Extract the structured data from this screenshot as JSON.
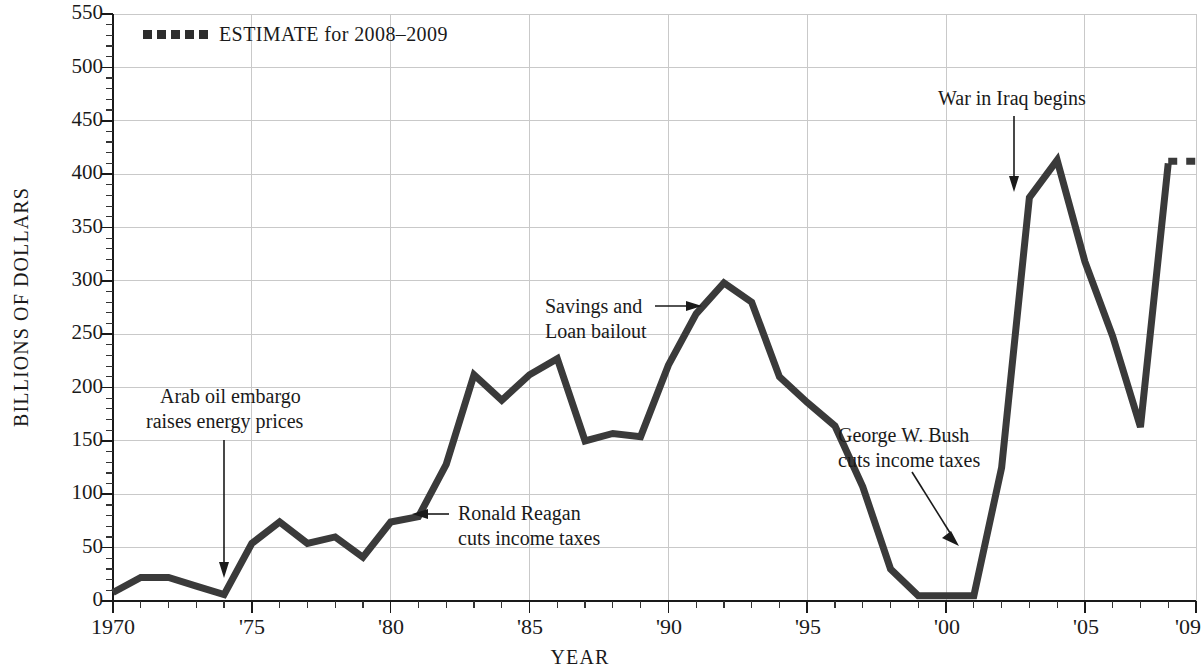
{
  "chart_data": {
    "type": "line",
    "title": "",
    "xlabel": "YEAR",
    "ylabel": "BILLIONS OF DOLLARS",
    "xlim": [
      1970,
      2009
    ],
    "ylim": [
      0,
      550
    ],
    "grid": true,
    "y_ticks": [
      0,
      50,
      100,
      150,
      200,
      250,
      300,
      350,
      400,
      450,
      500,
      550
    ],
    "y_tick_labels": [
      "0",
      "50",
      "100",
      "150",
      "200",
      "250",
      "300",
      "350",
      "400",
      "450",
      "500",
      "550"
    ],
    "y_minor_step": 10,
    "x_ticks": [
      1970,
      1975,
      1980,
      1985,
      1990,
      1995,
      2000,
      2005,
      2009
    ],
    "x_tick_labels": [
      "1970",
      "'75",
      "'80",
      "'85",
      "'90",
      "'95",
      "'00",
      "'05",
      "'09"
    ],
    "x_minor_step": 1,
    "legend_position": "top-left",
    "legend": [
      {
        "label": "ESTIMATE for 2008–2009",
        "style": "dotted",
        "color": "#2d2d2d"
      }
    ],
    "series": [
      {
        "name": "Federal budget deficit",
        "style": "solid",
        "color": "#3a3a3a",
        "x": [
          1970,
          1971,
          1972,
          1973,
          1974,
          1975,
          1976,
          1977,
          1978,
          1979,
          1980,
          1981,
          1982,
          1983,
          1984,
          1985,
          1986,
          1987,
          1988,
          1989,
          1990,
          1991,
          1992,
          1993,
          1994,
          1995,
          1996,
          1997,
          1998,
          1999,
          2000,
          2001,
          2002,
          2003,
          2004,
          2005,
          2006,
          2007,
          2008
        ],
        "values": [
          8,
          22,
          22,
          14,
          6,
          54,
          74,
          54,
          60,
          41,
          74,
          79,
          128,
          212,
          188,
          212,
          227,
          150,
          157,
          154,
          221,
          269,
          298,
          280,
          210,
          186,
          164,
          107,
          30,
          5,
          5,
          5,
          125,
          378,
          413,
          318,
          248,
          163,
          410
        ]
      },
      {
        "name": "ESTIMATE for 2008–2009",
        "style": "dotted",
        "color": "#2d2d2d",
        "x": [
          2008,
          2009
        ],
        "values": [
          412,
          412
        ]
      }
    ],
    "annotations": [
      {
        "id": "arab-oil-embargo",
        "lines": [
          "Arab oil embargo",
          "raises energy prices"
        ],
        "arrow": "down",
        "points_to_year": 1974,
        "points_to_value": 20
      },
      {
        "id": "ronald-reagan-tax-cuts",
        "lines": [
          "Ronald Reagan",
          "cuts income taxes"
        ],
        "arrow": "left",
        "points_to_year": 1981,
        "points_to_value": 79
      },
      {
        "id": "savings-and-loan-bailout",
        "lines": [
          "Savings and",
          "Loan bailout"
        ],
        "arrow": "right",
        "points_to_year": 1991,
        "points_to_value": 269
      },
      {
        "id": "george-w-bush-tax-cuts",
        "lines": [
          "George W. Bush",
          "cuts income taxes"
        ],
        "arrow": "diagonal-down-right",
        "points_to_year": 2001,
        "points_to_value": 60
      },
      {
        "id": "war-in-iraq-begins",
        "lines": [
          "War in Iraq begins"
        ],
        "arrow": "down",
        "points_to_year": 2003,
        "points_to_value": 378
      }
    ]
  },
  "axis": {
    "y_title": "BILLIONS OF DOLLARS",
    "x_title": "YEAR"
  },
  "legend": {
    "estimate_label": "ESTIMATE for 2008–2009"
  },
  "ylabels": {
    "t0": "0",
    "t50": "50",
    "t100": "100",
    "t150": "150",
    "t200": "200",
    "t250": "250",
    "t300": "300",
    "t350": "350",
    "t400": "400",
    "t450": "450",
    "t500": "500",
    "t550": "550"
  },
  "xlabels": {
    "x1970": "1970",
    "x1975": "'75",
    "x1980": "'80",
    "x1985": "'85",
    "x1990": "'90",
    "x1995": "'95",
    "x2000": "'00",
    "x2005": "'05",
    "x2009": "'09"
  },
  "annotations": {
    "arab_l1": "Arab oil embargo",
    "arab_l2": "raises energy prices",
    "reagan_l1": "Ronald Reagan",
    "reagan_l2": "cuts income taxes",
    "snl_l1": "Savings and",
    "snl_l2": "Loan bailout",
    "bush_l1": "George W. Bush",
    "bush_l2": "cuts income taxes",
    "iraq_l1": "War in Iraq begins"
  }
}
